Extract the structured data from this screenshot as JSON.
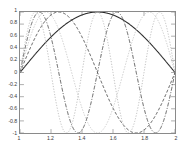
{
  "figure": {
    "background_color": "#ffffff",
    "frame_color": "#8a8a8a",
    "width": 185,
    "height": 152
  },
  "axes": {
    "x_tick_labels": [
      "1",
      "1.2",
      "1.4",
      "1.6",
      "1.8",
      "2"
    ],
    "x_tick_values": [
      1,
      1.2,
      1.4,
      1.6,
      1.8,
      2
    ],
    "y_tick_labels": [
      "-1",
      "-0.8",
      "-0.6",
      "-0.4",
      "-0.2",
      "0",
      "0.2",
      "0.4",
      "0.6",
      "0.8",
      "1"
    ],
    "y_tick_values": [
      -1,
      -0.8,
      -0.6,
      -0.4,
      -0.2,
      0,
      0.2,
      0.4,
      0.6,
      0.8,
      1
    ]
  },
  "chart_data": {
    "type": "line",
    "title": "",
    "xlabel": "",
    "ylabel": "",
    "xlim": [
      1,
      2
    ],
    "ylim": [
      -1,
      1
    ],
    "grid": false,
    "legend": "none",
    "x_ticks": [
      1,
      1.2,
      1.4,
      1.6,
      1.8,
      2
    ],
    "y_ticks": [
      -1,
      -0.8,
      -0.6,
      -0.4,
      -0.2,
      0,
      0.2,
      0.4,
      0.6,
      0.8,
      1
    ],
    "series": [
      {
        "name": "sin(pi*(x-1))",
        "harmonic": 1,
        "color": "#2b2b2b",
        "line_style": "solid",
        "line_width": 1.1,
        "dash_pattern": "",
        "peaks": [
          {
            "x": 1.5,
            "y": 1
          }
        ],
        "troughs": [],
        "zeros": [
          1,
          2
        ]
      },
      {
        "name": "sin(2*pi*(x-1))",
        "harmonic": 2,
        "color": "#4a4a4a",
        "line_style": "dashed",
        "line_width": 1.0,
        "dash_pattern": "3,2",
        "peaks": [
          {
            "x": 1.25,
            "y": 1
          }
        ],
        "troughs": [
          {
            "x": 1.75,
            "y": -1
          }
        ],
        "zeros": [
          1,
          1.5,
          2
        ]
      },
      {
        "name": "sin(3*pi*(x-1))",
        "harmonic": 3,
        "color": "#c9c9c9",
        "line_style": "dotted",
        "line_width": 1.0,
        "dash_pattern": "1.4,1.4",
        "peaks": [
          {
            "x": 1.1667,
            "y": 1
          },
          {
            "x": 1.8333,
            "y": 1
          }
        ],
        "troughs": [
          {
            "x": 1.5,
            "y": -1
          }
        ],
        "zeros": [
          1,
          1.3333,
          1.6667,
          2
        ]
      },
      {
        "name": "sin(4*pi*(x-1))",
        "harmonic": 4,
        "color": "#5a5a5a",
        "line_style": "dash-dot",
        "line_width": 1.0,
        "dash_pattern": "4,1.6,1,1.6",
        "peaks": [
          {
            "x": 1.125,
            "y": 1
          },
          {
            "x": 1.625,
            "y": 1
          }
        ],
        "troughs": [
          {
            "x": 1.375,
            "y": -1
          },
          {
            "x": 1.875,
            "y": -1
          }
        ],
        "zeros": [
          1,
          1.25,
          1.5,
          1.75,
          2
        ]
      },
      {
        "name": "sin(5*pi*(x-1))",
        "harmonic": 5,
        "color": "#bdbdbd",
        "line_style": "dotted",
        "line_width": 1.0,
        "dash_pattern": "1.2,1.6",
        "peaks": [
          {
            "x": 1.1,
            "y": 1
          },
          {
            "x": 1.5,
            "y": 1
          },
          {
            "x": 1.9,
            "y": 1
          }
        ],
        "troughs": [
          {
            "x": 1.3,
            "y": -1
          },
          {
            "x": 1.7,
            "y": -1
          }
        ],
        "zeros": [
          1,
          1.2,
          1.4,
          1.6,
          1.8,
          2
        ]
      }
    ]
  }
}
